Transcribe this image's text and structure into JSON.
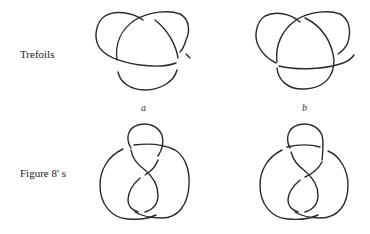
{
  "rows": [
    {
      "label": "Trefoils"
    },
    {
      "label": "Figure 8' s"
    }
  ],
  "sublabels": [
    "a",
    "b"
  ],
  "knots": [
    {
      "name": "trefoil-a",
      "type": "trefoil",
      "variant": "a"
    },
    {
      "name": "trefoil-b",
      "type": "trefoil",
      "variant": "b"
    },
    {
      "name": "figure-eight-a",
      "type": "figure-eight",
      "variant": "a"
    },
    {
      "name": "figure-eight-b",
      "type": "figure-eight",
      "variant": "b"
    }
  ]
}
